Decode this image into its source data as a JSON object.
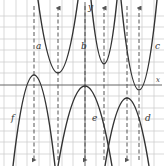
{
  "figure": {
    "axes": {
      "x_label": "x",
      "y_label": "y"
    },
    "grid": {
      "visible": true,
      "color": "#c8c8c8"
    },
    "curve_color": "#333333",
    "axis_color": "#555555",
    "parabolas": [
      {
        "label": "a",
        "opens": "up"
      },
      {
        "label": "b",
        "opens": "up"
      },
      {
        "label": "c",
        "opens": "up"
      },
      {
        "label": "d",
        "opens": "down"
      },
      {
        "label": "e",
        "opens": "down"
      },
      {
        "label": "f",
        "opens": "down"
      }
    ]
  }
}
